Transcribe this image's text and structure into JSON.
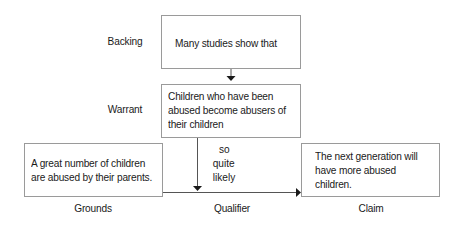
{
  "diagram": {
    "type": "toulmin-argument-model",
    "labels": {
      "backing": "Backing",
      "warrant": "Warrant",
      "grounds": "Grounds",
      "qualifier": "Qualifier",
      "claim": "Claim"
    },
    "boxes": {
      "backing": {
        "lines": [
          "Many studies show that"
        ]
      },
      "warrant": {
        "lines": [
          "Children who have been",
          "abused become abusers of",
          "their children"
        ]
      },
      "grounds": {
        "lines": [
          "A great number of children",
          "are abused by their parents."
        ]
      },
      "claim": {
        "lines": [
          "The next generation will",
          "have more abused",
          "children."
        ]
      }
    },
    "qualifier_text": {
      "lines": [
        "so",
        "quite",
        "likely"
      ]
    },
    "colors": {
      "border": "#9a9a9a",
      "line": "#555555",
      "arrow": "#1a1a1a",
      "text": "#1a1a1a"
    }
  }
}
